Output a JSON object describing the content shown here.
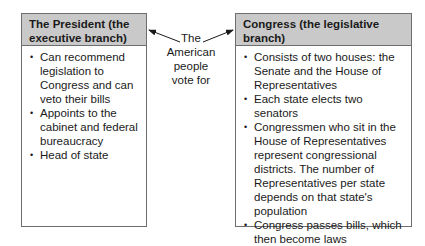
{
  "president": {
    "title": "The President (the executive branch)",
    "items": [
      "Can recommend legislation to Congress and can veto their bills",
      "Appoints to the cabinet and federal bureaucracy",
      "Head of state"
    ]
  },
  "connector": {
    "lines": [
      "The",
      "American",
      "people",
      "vote for"
    ]
  },
  "congress": {
    "title": "Congress (the legislative branch)",
    "items": [
      "Consists of two houses: the Senate and the House of Representatives",
      "Each state elects two senators",
      "Congressmen who sit in the House of Representatives represent congressional districts. The number of Representatives per state depends on that state's population",
      "Congress passes bills, which then become laws"
    ]
  },
  "colors": {
    "header_bg": "#c9c9c9",
    "border": "#6e6e6e",
    "text": "#1a1a1a"
  }
}
